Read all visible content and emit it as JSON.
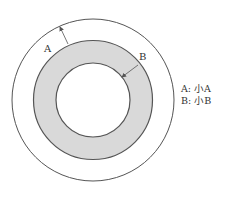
{
  "diagram": {
    "labels": {
      "a": "A",
      "b": "B"
    },
    "legend": [
      {
        "key": "A:",
        "text": "小A"
      },
      {
        "key": "B:",
        "text": "小B"
      }
    ],
    "colors": {
      "stroke": "#555555",
      "ring_fill": "#d9d9d9",
      "background": "#ffffff"
    }
  }
}
